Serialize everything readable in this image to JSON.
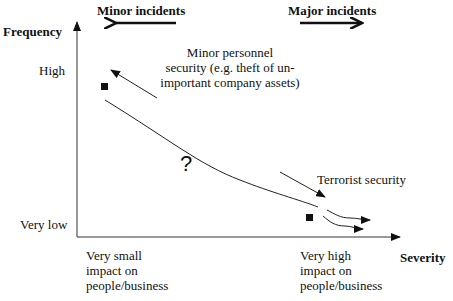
{
  "header": {
    "minor_incidents": "Minor incidents",
    "major_incidents": "Major incidents"
  },
  "axes": {
    "y_label": "Frequency",
    "x_label": "Severity",
    "y_ticks": {
      "high": "High",
      "very_low": "Very low"
    },
    "x_ticks": {
      "left": [
        "Very small",
        "impact on",
        "people/business"
      ],
      "right": [
        "Very high",
        "impact on",
        "people/business"
      ]
    }
  },
  "annotations": {
    "minor_personnel": [
      "Minor personnel",
      "security (e.g. theft of un-",
      "important company assets)"
    ],
    "terrorist": "Terrorist security",
    "question": "?"
  },
  "colors": {
    "ink": "#111111",
    "background": "#ffffff"
  }
}
